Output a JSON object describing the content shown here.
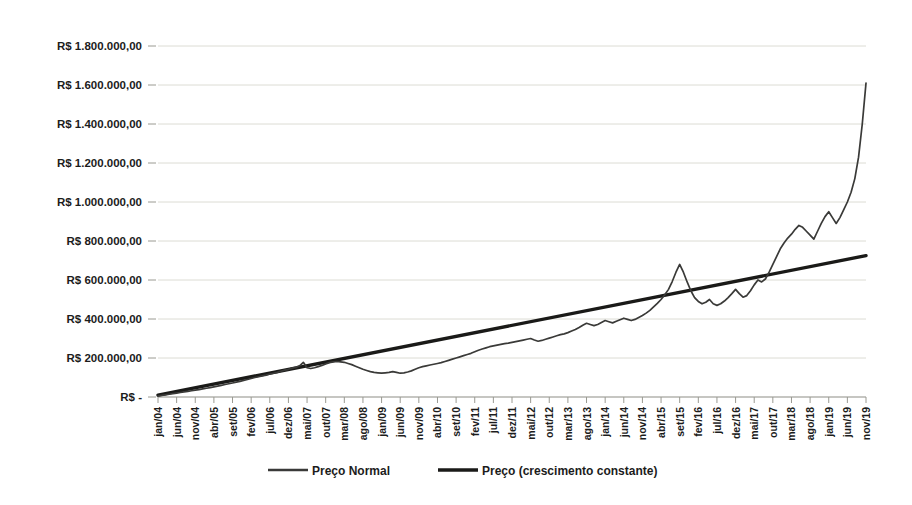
{
  "chart_data": {
    "type": "line",
    "title": "",
    "xlabel": "",
    "ylabel": "",
    "grid": true,
    "legend_position": "bottom",
    "ylim": [
      0,
      1800000
    ],
    "y_ticks": [
      0,
      200000,
      400000,
      600000,
      800000,
      1000000,
      1200000,
      1400000,
      1600000,
      1800000
    ],
    "y_tick_labels": [
      "R$ -",
      "R$ 200.000,00",
      "R$ 400.000,00",
      "R$ 600.000,00",
      "R$ 800.000,00",
      "R$ 1.000.000,00",
      "R$ 1.200.000,00",
      "R$ 1.400.000,00",
      "R$ 1.600.000,00",
      "R$ 1.800.000,00"
    ],
    "x_tick_labels": [
      "jan/04",
      "jun/04",
      "nov/04",
      "abr/05",
      "set/05",
      "fev/06",
      "jul/06",
      "dez/06",
      "mai/07",
      "out/07",
      "mar/08",
      "ago/08",
      "jan/09",
      "jun/09",
      "nov/09",
      "abr/10",
      "set/10",
      "fev/11",
      "jul/11",
      "dez/11",
      "mai/12",
      "out/12",
      "mar/13",
      "ago/13",
      "jan/14",
      "jun/14",
      "nov/14",
      "abr/15",
      "set/15",
      "fev/16",
      "jul/16",
      "dez/16",
      "mai/17",
      "out/17",
      "mar/18",
      "ago/18",
      "jan/19",
      "jun/19",
      "nov/19"
    ],
    "series": [
      {
        "name": "Preço Normal",
        "color": "#3a3a38",
        "line_width": 1.7,
        "x": [
          "jan/04",
          "fev/04",
          "mar/04",
          "abr/04",
          "mai/04",
          "jun/04",
          "jul/04",
          "ago/04",
          "set/04",
          "out/04",
          "nov/04",
          "dez/04",
          "jan/05",
          "fev/05",
          "mar/05",
          "abr/05",
          "mai/05",
          "jun/05",
          "jul/05",
          "ago/05",
          "set/05",
          "out/05",
          "nov/05",
          "dez/05",
          "jan/06",
          "fev/06",
          "mar/06",
          "abr/06",
          "mai/06",
          "jun/06",
          "jul/06",
          "ago/06",
          "set/06",
          "out/06",
          "nov/06",
          "dez/06",
          "jan/07",
          "fev/07",
          "mar/07",
          "abr/07",
          "mai/07",
          "jun/07",
          "jul/07",
          "ago/07",
          "set/07",
          "out/07",
          "nov/07",
          "dez/07",
          "jan/08",
          "fev/08",
          "mar/08",
          "abr/08",
          "mai/08",
          "jun/08",
          "jul/08",
          "ago/08",
          "set/08",
          "out/08",
          "nov/08",
          "dez/08",
          "jan/09",
          "fev/09",
          "mar/09",
          "abr/09",
          "mai/09",
          "jun/09",
          "jul/09",
          "ago/09",
          "set/09",
          "out/09",
          "nov/09",
          "dez/09",
          "jan/10",
          "fev/10",
          "mar/10",
          "abr/10",
          "mai/10",
          "jun/10",
          "jul/10",
          "ago/10",
          "set/10",
          "out/10",
          "nov/10",
          "dez/10",
          "jan/11",
          "fev/11",
          "mar/11",
          "abr/11",
          "mai/11",
          "jun/11",
          "jul/11",
          "ago/11",
          "set/11",
          "out/11",
          "nov/11",
          "dez/11",
          "jan/12",
          "fev/12",
          "mar/12",
          "abr/12",
          "mai/12",
          "jun/12",
          "jul/12",
          "ago/12",
          "set/12",
          "out/12",
          "nov/12",
          "dez/12",
          "jan/13",
          "fev/13",
          "mar/13",
          "abr/13",
          "mai/13",
          "jun/13",
          "jul/13",
          "ago/13",
          "set/13",
          "out/13",
          "nov/13",
          "dez/13",
          "jan/14",
          "fev/14",
          "mar/14",
          "abr/14",
          "mai/14",
          "jun/14",
          "jul/14",
          "ago/14",
          "set/14",
          "out/14",
          "nov/14",
          "dez/14",
          "jan/15",
          "fev/15",
          "mar/15",
          "abr/15",
          "mai/15",
          "jun/15",
          "jul/15",
          "ago/15",
          "set/15",
          "out/15",
          "nov/15",
          "dez/15",
          "jan/16",
          "fev/16",
          "mar/16",
          "abr/16",
          "mai/16",
          "jun/16",
          "jul/16",
          "ago/16",
          "set/16",
          "out/16",
          "nov/16",
          "dez/16",
          "jan/17",
          "fev/17",
          "mar/17",
          "abr/17",
          "mai/17",
          "jun/17",
          "jul/17",
          "ago/17",
          "set/17",
          "out/17",
          "nov/17",
          "dez/17",
          "jan/18",
          "fev/18",
          "mar/18",
          "abr/18",
          "mai/18",
          "jun/18",
          "jul/18",
          "ago/18",
          "set/18",
          "out/18",
          "nov/18",
          "dez/18",
          "jan/19",
          "fev/19",
          "mar/19",
          "abr/19",
          "mai/19",
          "jun/19",
          "jul/19",
          "ago/19",
          "set/19",
          "out/19",
          "nov/19"
        ],
        "values": [
          5000,
          8000,
          11000,
          14000,
          17000,
          20000,
          23000,
          26000,
          29000,
          32000,
          35000,
          38000,
          42000,
          45000,
          48000,
          52000,
          56000,
          60000,
          64000,
          68000,
          72000,
          76000,
          80000,
          85000,
          90000,
          95000,
          100000,
          104000,
          108000,
          112000,
          118000,
          122000,
          126000,
          132000,
          138000,
          142000,
          148000,
          152000,
          160000,
          178000,
          150000,
          146000,
          150000,
          156000,
          162000,
          170000,
          176000,
          180000,
          182000,
          180000,
          178000,
          172000,
          166000,
          158000,
          150000,
          142000,
          136000,
          130000,
          126000,
          124000,
          122000,
          124000,
          126000,
          130000,
          126000,
          122000,
          124000,
          128000,
          134000,
          142000,
          150000,
          156000,
          160000,
          164000,
          168000,
          172000,
          176000,
          182000,
          188000,
          194000,
          200000,
          206000,
          212000,
          218000,
          224000,
          232000,
          240000,
          246000,
          252000,
          258000,
          262000,
          266000,
          270000,
          274000,
          276000,
          280000,
          284000,
          288000,
          292000,
          296000,
          300000,
          292000,
          286000,
          290000,
          296000,
          302000,
          308000,
          314000,
          320000,
          324000,
          330000,
          338000,
          346000,
          356000,
          368000,
          378000,
          372000,
          366000,
          372000,
          382000,
          392000,
          386000,
          380000,
          388000,
          396000,
          404000,
          398000,
          392000,
          398000,
          408000,
          418000,
          430000,
          444000,
          462000,
          480000,
          500000,
          524000,
          552000,
          592000,
          640000,
          680000,
          640000,
          590000,
          545000,
          510000,
          490000,
          478000,
          486000,
          500000,
          478000,
          470000,
          478000,
          492000,
          510000,
          530000,
          552000,
          530000,
          512000,
          520000,
          545000,
          575000,
          600000,
          590000,
          605000,
          640000,
          680000,
          720000,
          760000,
          790000,
          815000,
          835000,
          860000,
          880000,
          870000,
          850000,
          830000,
          810000,
          850000,
          890000,
          925000,
          950000,
          920000,
          890000,
          920000,
          960000,
          1000000,
          1050000,
          1120000,
          1230000,
          1400000,
          1610000
        ]
      },
      {
        "name": "Preço (crescimento constante)",
        "color": "#1a1a18",
        "line_width": 3.4,
        "x": [
          "jan/04",
          "nov/19"
        ],
        "values": [
          10000,
          725000
        ]
      }
    ]
  },
  "legend": {
    "items": [
      {
        "label": "Preço Normal",
        "style": "thin"
      },
      {
        "label": "Preço (crescimento constante)",
        "style": "thick"
      }
    ]
  },
  "colors": {
    "gridline": "#dcdcd4",
    "axis": "#8d8d85",
    "series_normal": "#3a3a38",
    "series_constant": "#1a1a18",
    "text": "#1c1c1c",
    "background": "#ffffff"
  }
}
